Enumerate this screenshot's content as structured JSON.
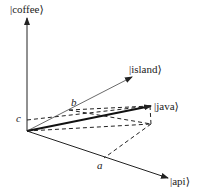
{
  "diagram": {
    "type": "vector-space",
    "axes": [
      {
        "id": "coffee",
        "label": "|coffee⟩"
      },
      {
        "id": "island",
        "label": "|island⟩"
      },
      {
        "id": "api",
        "label": "|api⟩"
      }
    ],
    "vector": {
      "id": "java",
      "label": "|java⟩"
    },
    "components": [
      {
        "id": "a",
        "label": "a",
        "axis": "api"
      },
      {
        "id": "b",
        "label": "b",
        "axis": "island"
      },
      {
        "id": "c",
        "label": "c",
        "axis": "coffee"
      }
    ],
    "colors": {
      "lines": "#222222",
      "background": "#ffffff"
    }
  }
}
